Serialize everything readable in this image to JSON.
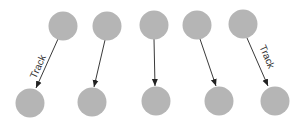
{
  "diagram": {
    "type": "track-association",
    "node_color": "#b5b5b5",
    "edge_color": "#222222",
    "node_radius": 14.5,
    "top_nodes": [
      {
        "id": "t1",
        "cx": 63,
        "cy": 26
      },
      {
        "id": "t2",
        "cx": 107,
        "cy": 26
      },
      {
        "id": "t3",
        "cx": 154,
        "cy": 25
      },
      {
        "id": "t4",
        "cx": 197,
        "cy": 25
      },
      {
        "id": "t5",
        "cx": 243,
        "cy": 24
      }
    ],
    "bottom_nodes": [
      {
        "id": "b1",
        "cx": 30,
        "cy": 103
      },
      {
        "id": "b2",
        "cx": 92,
        "cy": 102
      },
      {
        "id": "b3",
        "cx": 156,
        "cy": 101
      },
      {
        "id": "b4",
        "cx": 219,
        "cy": 101
      },
      {
        "id": "b5",
        "cx": 275,
        "cy": 101
      }
    ],
    "edges": [
      {
        "from": "t1",
        "to": "b1",
        "x1": 58,
        "y1": 39,
        "x2": 36,
        "y2": 88,
        "label": "Track"
      },
      {
        "from": "t2",
        "to": "b2",
        "x1": 105,
        "y1": 40,
        "x2": 94,
        "y2": 87,
        "label": ""
      },
      {
        "from": "t3",
        "to": "b3",
        "x1": 154,
        "y1": 39,
        "x2": 155,
        "y2": 86,
        "label": ""
      },
      {
        "from": "t4",
        "to": "b4",
        "x1": 200,
        "y1": 39,
        "x2": 216,
        "y2": 86,
        "label": ""
      },
      {
        "from": "t5",
        "to": "b5",
        "x1": 247,
        "y1": 38,
        "x2": 268,
        "y2": 86,
        "label": "Track"
      }
    ],
    "labels": {
      "left_track": "Track",
      "right_track": "Track"
    }
  }
}
